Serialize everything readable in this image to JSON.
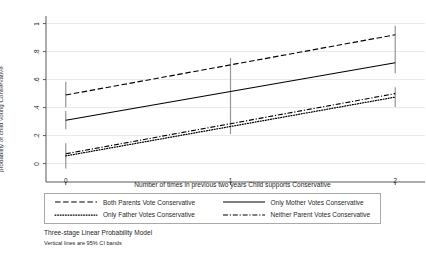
{
  "chart_data": {
    "type": "line",
    "title": "",
    "xlabel": "Number of times in previous two years Child supports Conservative",
    "ylabel": "probability of child voting Conservative",
    "x": [
      0,
      1,
      2
    ],
    "xtick_labels": [
      "0",
      "1",
      "2"
    ],
    "xlim": [
      -0.12,
      2.12
    ],
    "ytick_labels": [
      "0",
      ".2",
      ".4",
      ".6",
      ".8",
      "1"
    ],
    "ytick_values": [
      0,
      0.2,
      0.4,
      0.6,
      0.8,
      1
    ],
    "ylim": [
      -0.06,
      1.04
    ],
    "grid": "horizontal",
    "legend_position": "below-plot",
    "series": [
      {
        "name": "Both Parents Vote Conservative",
        "style": "dashed",
        "values": [
          0.49,
          0.705,
          0.92
        ],
        "ci_low": [
          0.4,
          0.655,
          0.855
        ],
        "ci_high": [
          0.585,
          0.755,
          0.985
        ]
      },
      {
        "name": "Only Mother Votes Conservative",
        "style": "solid",
        "values": [
          0.31,
          0.515,
          0.72
        ],
        "ci_low": [
          0.245,
          0.465,
          0.645
        ],
        "ci_high": [
          0.375,
          0.565,
          0.79
        ]
      },
      {
        "name": "Only Father Votes Conservative",
        "style": "dotted",
        "values": [
          0.055,
          0.265,
          0.475
        ],
        "ci_low": [
          -0.035,
          0.21,
          0.405
        ],
        "ci_high": [
          0.145,
          0.32,
          0.545
        ]
      },
      {
        "name": "Neither Parent Votes Conservative",
        "style": "dash-dot",
        "values": [
          0.07,
          0.285,
          0.5
        ],
        "ci_low": [
          -0.035,
          0.21,
          0.405
        ],
        "ci_high": [
          0.145,
          0.32,
          0.545
        ]
      }
    ],
    "ci_bands": [
      {
        "x": 0,
        "low": -0.035,
        "high": 0.145
      },
      {
        "x": 0,
        "low": 0.245,
        "high": 0.375
      },
      {
        "x": 0,
        "low": 0.4,
        "high": 0.585
      },
      {
        "x": 1,
        "low": 0.21,
        "high": 0.755
      },
      {
        "x": 2,
        "low": 0.405,
        "high": 0.545
      },
      {
        "x": 2,
        "low": 0.645,
        "high": 0.985
      }
    ],
    "annotations": [
      "Three-stage Linear Probability Model",
      "Vertical lines are 95% CI bands"
    ],
    "colors": {
      "line": "#000000",
      "grid": "#e8e8e8",
      "axis": "#5a5a5a",
      "ci_band": "#969696",
      "legend_border": "#a9a9a9",
      "background": "#ffffff"
    }
  },
  "legend": {
    "entries": [
      {
        "label": "Both Parents Vote Conservative",
        "style": "dashed"
      },
      {
        "label": "Only Mother Votes Conservative",
        "style": "solid"
      },
      {
        "label": "Only Father Votes Conservative",
        "style": "dotted"
      },
      {
        "label": "Neither Parent Votes Conservative",
        "style": "dash-dot"
      }
    ]
  },
  "notes": {
    "line1": "Three-stage Linear Probability Model",
    "line2": "Vertical lines are 95% CI bands"
  }
}
